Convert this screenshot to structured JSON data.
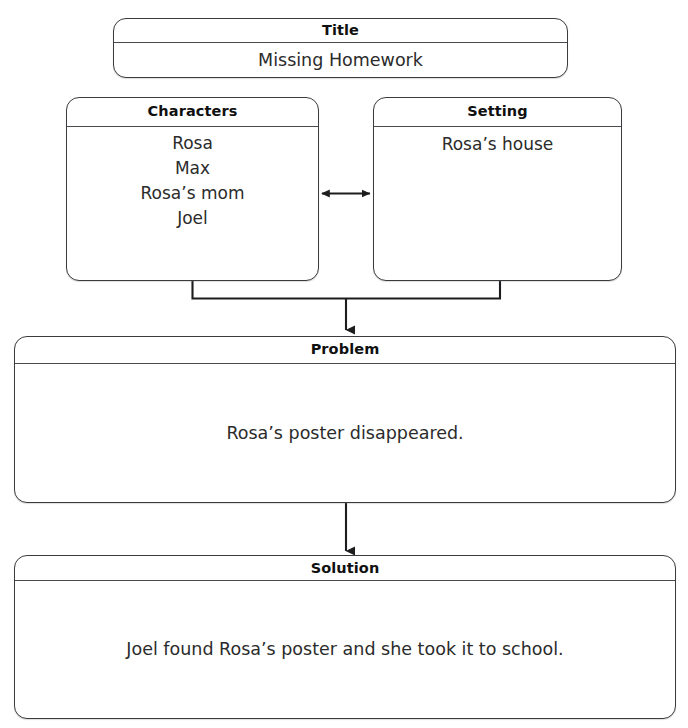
{
  "document": {
    "kind": "story-map-graphic-organizer",
    "scan_fragment": "",
    "stroke_color": "#3b3b3f",
    "background_color": "#ffffff",
    "text_color": "#2b2b2b"
  },
  "nodes": {
    "title": {
      "header": "Title",
      "body": "Missing Homework"
    },
    "characters": {
      "header": "Characters",
      "items": [
        "Rosa",
        "Max",
        "Rosa’s mom",
        "Joel"
      ]
    },
    "setting": {
      "header": "Setting",
      "body": "Rosa’s house"
    },
    "problem": {
      "header": "Problem",
      "body": "Rosa’s poster disappeared."
    },
    "solution": {
      "header": "Solution",
      "body": "Joel found Rosa’s poster and she took it to school."
    }
  },
  "connectors": [
    {
      "name": "characters-setting-double-arrow",
      "from": "characters",
      "to": "setting",
      "style": "double-headed-horizontal-arrow"
    },
    {
      "name": "characters-setting-to-problem",
      "from": [
        "characters",
        "setting"
      ],
      "to": "problem",
      "style": "bracket-join-arrow-down"
    },
    {
      "name": "problem-to-solution",
      "from": "problem",
      "to": "solution",
      "style": "arrow-down"
    }
  ]
}
